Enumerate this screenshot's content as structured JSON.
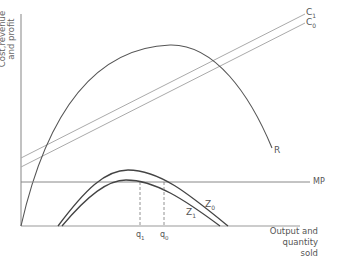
{
  "diagram": {
    "axes": {
      "y_label_line1": "Cost,revenue",
      "y_label_line2": "and profit",
      "x_label_line1": "Output and",
      "x_label_line2": "quantity sold"
    },
    "curves": {
      "revenue": "R",
      "cost_1": "C1",
      "cost_0": "C0",
      "marginal_profit": "MP",
      "profit_0": "Z0",
      "profit_1": "Z1"
    },
    "labels": {
      "c1": "C",
      "c1_sub": "1",
      "c0": "C",
      "c0_sub": "0",
      "r": "R",
      "mp": "MP",
      "z0": "Z",
      "z0_sub": "0",
      "z1": "Z",
      "z1_sub": "1",
      "q1": "q",
      "q1_sub": "1",
      "q0": "q",
      "q0_sub": "0"
    },
    "colors": {
      "axis": "#999999",
      "revenue": "#555555",
      "cost": "#aaaaaa",
      "mp": "#888888",
      "profit": "#444444",
      "dashed": "#777777"
    }
  }
}
